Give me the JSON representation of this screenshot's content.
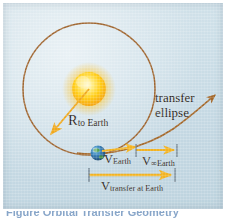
{
  "figure": {
    "background_color": "#c9dce6",
    "panel_border_color": "#ffffff"
  },
  "labels": {
    "radius": {
      "main": "R",
      "sub": "to Earth"
    },
    "transfer_ellipse_line1": "transfer",
    "transfer_ellipse_line2": "ellipse",
    "v_earth": {
      "main": "V",
      "sub": "Earth"
    },
    "v_infinity_earth": {
      "main": "V",
      "sub": "∞Earth"
    },
    "v_transfer": {
      "main": "V",
      "sub": "transfer at Earth"
    }
  },
  "bodies": {
    "sun": {
      "name": "sun",
      "color_core": "#fff9d0",
      "color_mid": "#ffd21f",
      "color_glow": "#f6a81c"
    },
    "earth": {
      "name": "earth",
      "color_ocean": "#2f6fa8",
      "color_land": "#4f9b45"
    }
  },
  "curves": {
    "earth_orbit": {
      "name": "earth-circular-orbit",
      "color": "#9a5a20",
      "style": "solid"
    },
    "transfer_ellipse": {
      "name": "transfer-ellipse-arc",
      "color": "#a2611f",
      "style": "solid",
      "arrowhead": true
    },
    "radius_arrow": {
      "name": "radius-arrow",
      "color": "#f0a81e"
    }
  },
  "vectors": [
    {
      "name": "v-earth-bar",
      "color": "#f2b322",
      "from_label": "Earth",
      "to_label": "V-infinity start"
    },
    {
      "name": "v-infinity-earth-bar",
      "color": "#f2b322",
      "from_label": "V-infinity start",
      "to_label": "transfer end"
    },
    {
      "name": "v-transfer-bar",
      "color": "#f2b322",
      "from_label": "bar start",
      "to_label": "bar end"
    }
  ],
  "caption": {
    "text": "Figure  Orbital Transfer Geometry"
  }
}
